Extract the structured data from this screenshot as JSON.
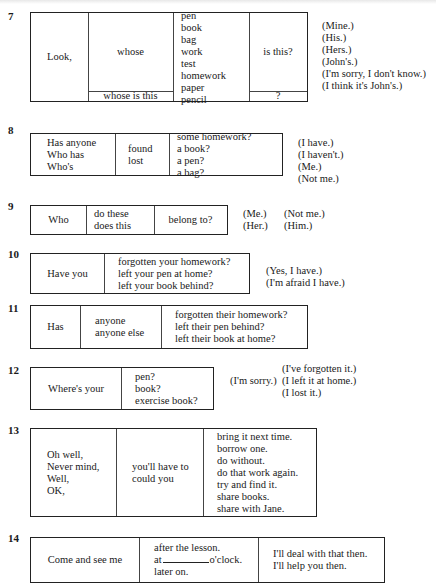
{
  "page": {
    "type": "substitution-table-exercises"
  },
  "exercises": {
    "ex7": {
      "number": "7",
      "col1": [
        "Look,"
      ],
      "col2_top": [
        "whose"
      ],
      "col2_bottom": [
        "whose is this"
      ],
      "col3": [
        "pen",
        "book",
        "bag",
        "work",
        "test",
        "homework",
        "paper",
        "pencil"
      ],
      "col4_top": [
        "is this?"
      ],
      "col4_bottom": [
        "?"
      ],
      "responses": [
        "(Mine.)",
        "(His.)",
        "(Hers.)",
        "(John's.)",
        "(I'm sorry, I don't know.)",
        "(I think it's John's.)"
      ]
    },
    "ex8": {
      "number": "8",
      "col1": [
        "Has anyone",
        "Who has",
        "Who's"
      ],
      "col2": [
        "found",
        "lost"
      ],
      "col3": [
        "some homework?",
        "a book?",
        "a pen?",
        "a bag?"
      ],
      "responses": [
        "(I have.)",
        "(I haven't.)",
        "(Me.)",
        "(Not me.)"
      ]
    },
    "ex9": {
      "number": "9",
      "col1": [
        "Who"
      ],
      "col2": [
        "do these",
        "does this"
      ],
      "col3": [
        "belong to?"
      ],
      "responses_a": [
        "(Me.)",
        "(Her.)"
      ],
      "responses_b": [
        "(Not me.)",
        "(Him.)"
      ]
    },
    "ex10": {
      "number": "10",
      "col1": [
        "Have you"
      ],
      "col2": [
        "forgotten your homework?",
        "left your pen at home?",
        "left your book behind?"
      ],
      "responses": [
        "(Yes, I have.)",
        "(I'm afraid I have.)"
      ]
    },
    "ex11": {
      "number": "11",
      "col1": [
        "Has"
      ],
      "col2": [
        "anyone",
        "anyone else"
      ],
      "col3": [
        "forgotten their homework?",
        "left their pen behind?",
        "left their book at home?"
      ]
    },
    "ex12": {
      "number": "12",
      "col1": [
        "Where's your"
      ],
      "col2": [
        "pen?",
        "book?",
        "exercise book?"
      ],
      "response_prefix": "(I'm sorry.)",
      "responses": [
        "(I've forgotten it.)",
        "(I left it at home.)",
        "(I lost it.)"
      ]
    },
    "ex13": {
      "number": "13",
      "col1": [
        "Oh well,",
        "Never mind,",
        "Well,",
        "OK,"
      ],
      "col2": [
        "you'll have to",
        "could you"
      ],
      "col3": [
        "bring it next time.",
        "borrow one.",
        "do without.",
        "do that work again.",
        "try and find it.",
        "share books.",
        "share with Jane."
      ]
    },
    "ex14": {
      "number": "14",
      "col1": [
        "Come and see me"
      ],
      "col2_line1": "after the lesson.",
      "col2_line2_before": "at",
      "col2_line2_after": "o'clock.",
      "col2_line3": "later on.",
      "col3": [
        "I'll deal with that then.",
        "I'll help you then."
      ]
    }
  }
}
